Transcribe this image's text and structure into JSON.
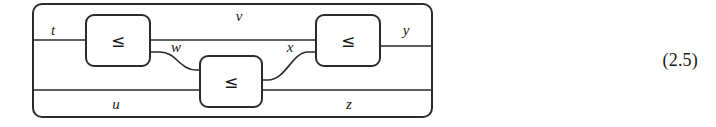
{
  "figure": {
    "kind": "string-diagram",
    "equation_number": "(2.5)",
    "background_color": "#ffffff",
    "line_color": "#2b2b2b",
    "outer_frame": {
      "label": "outer-wrapper-box",
      "x": 33,
      "y": 4,
      "width": 399,
      "height": 113,
      "corner_radius": 9
    },
    "boxes": [
      {
        "id": "box-left",
        "label": "≤",
        "x": 86,
        "y": 15,
        "width": 64,
        "height": 51,
        "corner_radius": 8,
        "inputs": 1,
        "outputs": 2
      },
      {
        "id": "box-middle",
        "label": "≤",
        "x": 200,
        "y": 56,
        "width": 62,
        "height": 51,
        "corner_radius": 8,
        "inputs": 2,
        "outputs": 1
      },
      {
        "id": "box-right",
        "label": "≤",
        "x": 316,
        "y": 15,
        "width": 64,
        "height": 51,
        "corner_radius": 8,
        "inputs": 2,
        "outputs": 1
      }
    ],
    "wires": [
      {
        "id": "wire-t",
        "label": "t",
        "label_x": 53,
        "label_y": 35,
        "role": "input-top-left"
      },
      {
        "id": "wire-u",
        "label": "u",
        "label_x": 116,
        "label_y": 109,
        "role": "input-bottom-left"
      },
      {
        "id": "wire-v",
        "label": "v",
        "label_x": 239,
        "label_y": 21,
        "role": "upper-through"
      },
      {
        "id": "wire-w",
        "label": "w",
        "label_x": 176,
        "label_y": 52,
        "role": "left-to-middle"
      },
      {
        "id": "wire-x",
        "label": "x",
        "label_x": 290,
        "label_y": 52,
        "role": "middle-to-right"
      },
      {
        "id": "wire-y",
        "label": "y",
        "label_x": 406,
        "label_y": 35,
        "role": "output-top-right"
      },
      {
        "id": "wire-z",
        "label": "z",
        "label_x": 349,
        "label_y": 109,
        "role": "output-bottom-right"
      }
    ]
  }
}
